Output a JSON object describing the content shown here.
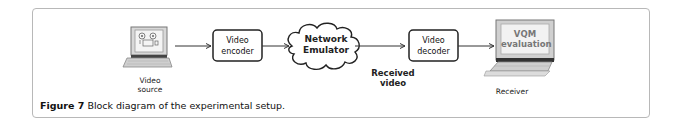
{
  "figure": {
    "caption_label": "Figure 7",
    "caption_text": " Block diagram of the experimental setup."
  },
  "nodes": {
    "source": {
      "label_line1": "Video",
      "label_line2": "source",
      "icon": "computer-with-tape-reels-icon"
    },
    "encoder": {
      "label_line1": "Video",
      "label_line2": "encoder"
    },
    "network": {
      "label_line1": "Network",
      "label_line2": "Emulator",
      "icon": "cloud-icon"
    },
    "received": {
      "label_line1": "Received",
      "label_line2": "video"
    },
    "decoder": {
      "label_line1": "Video",
      "label_line2": "decoder"
    },
    "receiver": {
      "screen_line1": "VQM",
      "screen_line2": "evaluation",
      "label": "Receiver",
      "icon": "computer-icon"
    }
  },
  "edges": [
    {
      "from": "source",
      "to": "encoder"
    },
    {
      "from": "encoder",
      "to": "network"
    },
    {
      "from": "network",
      "to": "decoder"
    },
    {
      "from": "decoder",
      "to": "receiver"
    }
  ]
}
